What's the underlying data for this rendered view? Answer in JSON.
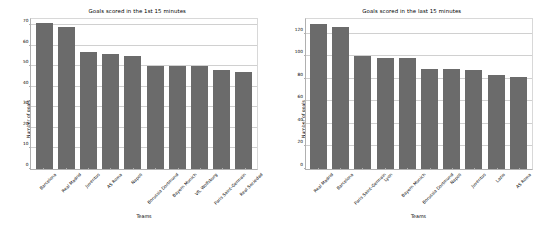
{
  "chart_data": [
    {
      "type": "bar",
      "title": "Goals scored in the 1st 15 minutes",
      "xlabel": "Teams",
      "ylabel": "Number of goals",
      "categories": [
        "Barcelona",
        "Real Madrid",
        "Juventus",
        "AS Roma",
        "Napoli",
        "Borussia Dortmund",
        "Bayern Munich",
        "VfL Wolfsburg",
        "Paris Saint-Germain",
        "Real Sociedad"
      ],
      "values": [
        71,
        69,
        57,
        56,
        55,
        50,
        50,
        50,
        48,
        47
      ],
      "ylim": [
        0,
        73
      ],
      "yticks": [
        0,
        10,
        20,
        30,
        40,
        50,
        60,
        70
      ],
      "grid": true,
      "legend": "none",
      "bar_color": "#6b6b6b"
    },
    {
      "type": "bar",
      "title": "Goals scored  in the last 15 minutes",
      "xlabel": "Teams",
      "ylabel": "Number of goals",
      "categories": [
        "Real Madrid",
        "Barcelona",
        "Paris Saint-Germain",
        "Lyon",
        "Bayern Munich",
        "Borussia Dortmund",
        "Napoli",
        "Juventus",
        "Lazio",
        "AS Roma"
      ],
      "values": [
        129,
        126,
        100,
        98,
        98,
        89,
        89,
        88,
        83,
        82
      ],
      "ylim": [
        0,
        133
      ],
      "yticks": [
        0,
        20,
        40,
        60,
        80,
        100,
        120
      ],
      "grid": true,
      "legend": "none",
      "bar_color": "#6b6b6b"
    }
  ]
}
